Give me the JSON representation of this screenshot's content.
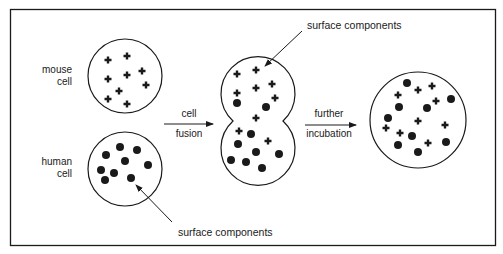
{
  "labels": {
    "mouse_line1": "mouse",
    "mouse_line2": "cell",
    "human_line1": "human",
    "human_line2": "cell",
    "fusion_top": "cell",
    "fusion_bottom": "fusion",
    "incubation_top": "further",
    "incubation_bottom": "incubation",
    "surface_top": "surface  components",
    "surface_bottom": "surface  components"
  },
  "colors": {
    "ink": "#1a1a1a",
    "background": "#ffffff"
  },
  "legend_markers": {
    "mouse_component": "cross",
    "human_component": "dot"
  },
  "cells": {
    "mouse": {
      "crosses": [
        [
          108,
          60
        ],
        [
          127,
          56
        ],
        [
          108,
          79
        ],
        [
          127,
          75
        ],
        [
          142,
          71
        ],
        [
          146,
          85
        ],
        [
          119,
          91
        ],
        [
          108,
          99
        ],
        [
          127,
          104
        ]
      ]
    },
    "human": {
      "dots": [
        [
          120,
          147
        ],
        [
          137,
          150
        ],
        [
          106,
          155
        ],
        [
          125,
          161
        ],
        [
          148,
          165
        ],
        [
          101,
          170
        ],
        [
          114,
          173
        ],
        [
          105,
          180
        ],
        [
          131,
          178
        ]
      ]
    },
    "fused": {
      "crosses": [
        [
          237,
          74
        ],
        [
          256,
          70
        ],
        [
          237,
          93
        ],
        [
          256,
          88
        ],
        [
          272,
          84
        ],
        [
          275,
          98
        ],
        [
          256,
          118
        ],
        [
          239,
          131
        ],
        [
          268,
          141
        ]
      ],
      "dots": [
        [
          237,
          103
        ],
        [
          266,
          107
        ],
        [
          251,
          134
        ],
        [
          238,
          144
        ],
        [
          256,
          152
        ],
        [
          279,
          154
        ],
        [
          231,
          160
        ],
        [
          246,
          162
        ],
        [
          262,
          168
        ]
      ]
    },
    "mixed": {
      "crosses": [
        [
          398,
          95
        ],
        [
          418,
          90
        ],
        [
          432,
          86
        ],
        [
          436,
          101
        ],
        [
          418,
          121
        ],
        [
          386,
          128
        ],
        [
          400,
          133
        ],
        [
          445,
          125
        ],
        [
          428,
          143
        ]
      ],
      "dots": [
        [
          407,
          83
        ],
        [
          399,
          107
        ],
        [
          427,
          108
        ],
        [
          451,
          99
        ],
        [
          388,
          118
        ],
        [
          412,
          136
        ],
        [
          398,
          145
        ],
        [
          418,
          152
        ],
        [
          446,
          142
        ]
      ]
    }
  }
}
